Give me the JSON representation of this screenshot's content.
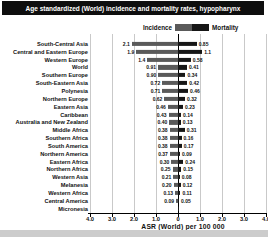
{
  "header": {
    "title": "Age standardized (World) incidence and mortality rates, hypopharynx"
  },
  "legend": {
    "incidence_label": "Incidence",
    "mortality_label": "Mortality"
  },
  "axis": {
    "title": "ASR (World) per 100 000",
    "ticks": [
      "4.0",
      "3.0",
      "2.0",
      "1.0",
      "0",
      "1.0",
      "2.0",
      "3.0",
      "4.0"
    ],
    "max_each_side": 4.0
  },
  "colors": {
    "header_bg": "#0e0e0e",
    "header_text": "#ffffff",
    "incidence_bar": "#5a5a5a",
    "mortality_bar": "#161616",
    "gridline": "#c9c9c9",
    "bottom_strip": "#cccccc"
  },
  "chart_data": {
    "type": "bar",
    "subtype": "diverging-horizontal-tornado",
    "title": "Age standardized (World) incidence and mortality rates, hypopharynx",
    "xlabel": "ASR (World) per 100 000",
    "axis_range_each_side": [
      0,
      4.0
    ],
    "grid": true,
    "legend_position": "top-center",
    "categories": [
      "South-Central Asia",
      "Central and Eastern Europe",
      "Western Europe",
      "World",
      "Southern Europe",
      "South-Eastern Asia",
      "Polynesia",
      "Northern Europe",
      "Eastern Asia",
      "Caribbean",
      "Australia and New Zealand",
      "Middle Africa",
      "Southern Africa",
      "South America",
      "Northern America",
      "Eastern Africa",
      "Northern Africa",
      "Western Asia",
      "Melanesia",
      "Western Africa",
      "Central America",
      "Micronesia"
    ],
    "series": [
      {
        "name": "Incidence",
        "direction": "left",
        "values": [
          2.1,
          1.9,
          1.4,
          0.91,
          0.9,
          0.72,
          0.71,
          0.62,
          0.46,
          0.43,
          0.4,
          0.38,
          0.38,
          0.38,
          0.37,
          0.3,
          0.25,
          0.21,
          0.2,
          0.13,
          0.09,
          0.02
        ]
      },
      {
        "name": "Mortality",
        "direction": "right",
        "values": [
          0.85,
          1.1,
          0.58,
          0.41,
          0.34,
          0.42,
          0.46,
          0.32,
          0.23,
          0.14,
          0.13,
          0.31,
          0.16,
          0.17,
          0.09,
          0.24,
          0.15,
          0.08,
          0.12,
          0.11,
          0.05,
          0.01
        ]
      }
    ],
    "value_labels": {
      "incidence": [
        "2.1",
        "1.9",
        "1.4",
        "0.91",
        "0.90",
        "0.72",
        "0.71",
        "0.62",
        "0.46",
        "0.43",
        "0.40",
        "0.38",
        "0.38",
        "0.38",
        "0.37",
        "0.30",
        "0.25",
        "0.21",
        "0.20",
        "0.13",
        "0.09",
        ""
      ],
      "mortality": [
        "0.85",
        "1.1",
        "0.58",
        "0.41",
        "0.34",
        "0.42",
        "0.46",
        "0.32",
        "0.23",
        "0.14",
        "0.13",
        "0.31",
        "0.16",
        "0.17",
        "0.09",
        "0.24",
        "0.15",
        "0.08",
        "0.12",
        "0.11",
        "0.05",
        ""
      ]
    }
  }
}
